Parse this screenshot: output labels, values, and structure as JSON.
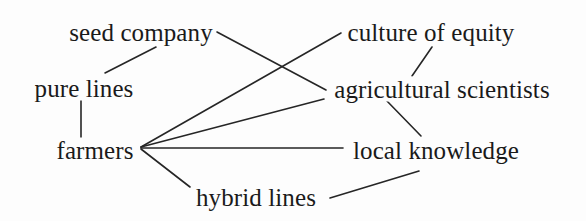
{
  "diagram": {
    "type": "node-link-network",
    "background_color": "#fdfdfd",
    "line_color": "#262626",
    "text_color": "#1a1a1a",
    "width": 586,
    "height": 221,
    "nodes": [
      {
        "id": "seed_company",
        "label": "seed company",
        "x": 141,
        "y": 32
      },
      {
        "id": "culture_of_equity",
        "label": "culture of equity",
        "x": 431,
        "y": 32
      },
      {
        "id": "pure_lines",
        "label": "pure lines",
        "x": 84,
        "y": 88
      },
      {
        "id": "agricultural_scientists",
        "label": "agricultural scientists",
        "x": 442,
        "y": 89
      },
      {
        "id": "farmers",
        "label": "farmers",
        "x": 95,
        "y": 150
      },
      {
        "id": "local_knowledge",
        "label": "local knowledge",
        "x": 436,
        "y": 150
      },
      {
        "id": "hybrid_lines",
        "label": "hybrid lines",
        "x": 256,
        "y": 197
      }
    ],
    "edges": [
      {
        "id": "e1",
        "from": "pure_lines",
        "to": "seed_company",
        "x1": 105,
        "y1": 73,
        "x2": 156,
        "y2": 47
      },
      {
        "id": "e2",
        "from": "seed_company",
        "to": "agricultural_scientists",
        "x1": 217,
        "y1": 32,
        "x2": 326,
        "y2": 90
      },
      {
        "id": "e3",
        "from": "pure_lines",
        "to": "farmers",
        "x1": 81,
        "y1": 100,
        "x2": 81,
        "y2": 139
      },
      {
        "id": "e4",
        "from": "culture_of_equity",
        "to": "agricultural_scientists",
        "x1": 432,
        "y1": 47,
        "x2": 412,
        "y2": 76
      },
      {
        "id": "e5",
        "from": "farmers",
        "to": "culture_of_equity",
        "x1": 141,
        "y1": 147,
        "x2": 341,
        "y2": 33
      },
      {
        "id": "e6",
        "from": "farmers",
        "to": "agricultural_scientists",
        "x1": 141,
        "y1": 147,
        "x2": 324,
        "y2": 99
      },
      {
        "id": "e7",
        "from": "farmers",
        "to": "local_knowledge",
        "x1": 141,
        "y1": 148,
        "x2": 343,
        "y2": 148
      },
      {
        "id": "e8",
        "from": "farmers",
        "to": "hybrid_lines",
        "x1": 141,
        "y1": 149,
        "x2": 190,
        "y2": 187
      },
      {
        "id": "e9",
        "from": "agricultural_scientists",
        "to": "local_knowledge",
        "x1": 386,
        "y1": 100,
        "x2": 421,
        "y2": 136
      },
      {
        "id": "e10",
        "from": "hybrid_lines",
        "to": "local_knowledge",
        "x1": 330,
        "y1": 198,
        "x2": 419,
        "y2": 171
      }
    ]
  }
}
